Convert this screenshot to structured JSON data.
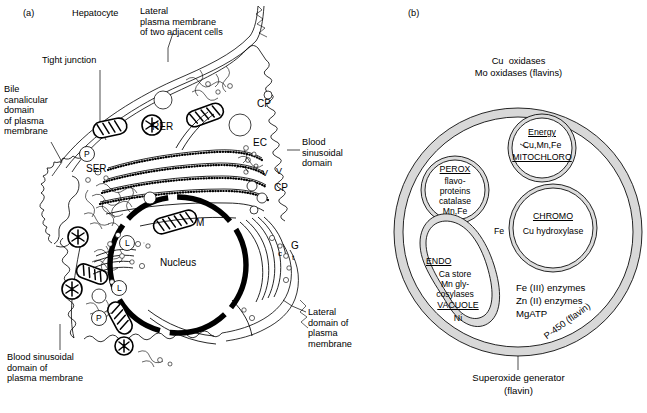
{
  "figure": {
    "panels": [
      {
        "tag": "(a)",
        "title": "Hepatocyte"
      },
      {
        "tag": "(b)",
        "title": ""
      }
    ]
  },
  "panel_a": {
    "tag": "(a)",
    "title": "Hepatocyte",
    "external_labels": [
      {
        "name": "lateral-plasma-membrane",
        "text": "Lateral\nplasma membrane\nof two adjacent cells"
      },
      {
        "name": "tight-junction",
        "text": "Tight junction"
      },
      {
        "name": "bile-canalicular-domain",
        "text": "Bile\ncanalicular\ndomain\nof plasma\nmembrane"
      },
      {
        "name": "blood-sinusoidal-domain",
        "text": "Blood\nsinusoidal\ndomain"
      },
      {
        "name": "lateral-domain-plasma-membrane",
        "text": "Lateral\ndomain of\nplasma\nmembrane"
      },
      {
        "name": "blood-sinusoidal-domain-of-plasma-membrane",
        "text": "Blood sinusoidal\ndomain of\nplasma membrane"
      }
    ],
    "internal_labels": [
      {
        "name": "nucleus",
        "text": "Nucleus"
      },
      {
        "name": "rer",
        "text": "RER"
      },
      {
        "name": "ser",
        "text": "SER"
      },
      {
        "name": "mitochondrion",
        "text": "M"
      },
      {
        "name": "golgi",
        "text": "G"
      },
      {
        "name": "endothelial-cell",
        "text": "EC"
      },
      {
        "name": "coated-pit-upper",
        "text": "CP"
      },
      {
        "name": "coated-pit-lower",
        "text": "CP"
      },
      {
        "name": "vesicle-left",
        "text": "V"
      },
      {
        "name": "vesicle-right",
        "text": "V"
      },
      {
        "name": "golgi-cis",
        "text": "c"
      },
      {
        "name": "golgi-trans",
        "text": "t"
      },
      {
        "name": "peroxisome-upper",
        "text": "P"
      },
      {
        "name": "peroxisome-lower",
        "text": "P"
      },
      {
        "name": "lysosome-upper",
        "text": "L"
      },
      {
        "name": "lysosome-mid",
        "text": "L"
      },
      {
        "name": "lysosome-lower",
        "text": "L"
      }
    ]
  },
  "panel_b": {
    "tag": "(b)",
    "outer_top_lines": [
      "Cu  oxidases",
      "Mo oxidases (flavins)"
    ],
    "membrane_label": "P-450 (flavin)",
    "bottom_caption": [
      "Superoxide generator",
      "(flavin)"
    ],
    "cytosol_lines": [
      "Fe (III) enzymes",
      "Zn (II) enzymes",
      "MgATP"
    ],
    "chromo_outside_label": "Fe",
    "organelles": [
      {
        "name": "mitochloro",
        "heading": "Energy",
        "metals": "Cu,Mn,Fe",
        "footer": "MITOCHLORO"
      },
      {
        "name": "perox",
        "heading": "PEROX",
        "lines": [
          "flavo-",
          "proteins",
          "catalase",
          "Mn,Fe"
        ]
      },
      {
        "name": "chromo",
        "heading": "CHROMO",
        "lines": [
          "Cu hydroxylase"
        ]
      },
      {
        "name": "endo-vacuole",
        "heading": "ENDO",
        "lines": [
          "Ca store",
          "Mn gly-",
          "cosylases"
        ],
        "sub_heading": "VACUOLE",
        "sub_lines": [
          "Ni"
        ]
      }
    ]
  },
  "colors": {
    "ink": "#000000",
    "membrane_fill": "#d8d8d8",
    "background": "#ffffff"
  }
}
